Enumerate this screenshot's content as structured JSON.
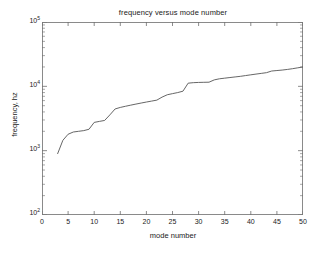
{
  "chart_data": {
    "type": "line",
    "title": "frequency versus mode number",
    "xlabel": "mode number",
    "ylabel": "frequency, hz",
    "xlim": [
      0,
      50
    ],
    "ylim": [
      100,
      100000
    ],
    "yscale": "log",
    "xscale": "linear",
    "grid": false,
    "legend": null,
    "xticks": [
      0,
      5,
      10,
      15,
      20,
      25,
      30,
      35,
      40,
      45,
      50
    ],
    "xtick_labels": [
      "0",
      "5",
      "10",
      "15",
      "20",
      "25",
      "30",
      "35",
      "40",
      "45",
      "50"
    ],
    "yticks": [
      100,
      1000,
      10000,
      100000
    ],
    "ytick_labels": [
      "10",
      "10",
      "10",
      "10"
    ],
    "ytick_exponents": [
      "2",
      "3",
      "4",
      "5"
    ],
    "line_color": "#555555",
    "x": [
      3,
      4,
      5,
      6,
      7,
      8,
      9,
      10,
      11,
      12,
      13,
      14,
      15,
      16,
      17,
      18,
      19,
      20,
      21,
      22,
      23,
      24,
      25,
      26,
      27,
      28,
      29,
      30,
      31,
      32,
      33,
      34,
      35,
      36,
      37,
      38,
      39,
      40,
      41,
      42,
      43,
      44,
      45,
      46,
      47,
      48,
      49,
      50
    ],
    "values": [
      900,
      1450,
      1800,
      1950,
      2000,
      2050,
      2150,
      2750,
      2850,
      2950,
      3600,
      4450,
      4700,
      4900,
      5100,
      5300,
      5500,
      5700,
      5900,
      6100,
      6800,
      7400,
      7700,
      8000,
      8400,
      11200,
      11400,
      11500,
      11550,
      11600,
      12600,
      13100,
      13400,
      13700,
      14000,
      14300,
      14700,
      15100,
      15500,
      15900,
      16300,
      17300,
      17600,
      17900,
      18300,
      18800,
      19400,
      20000
    ],
    "series_name": "frequency"
  }
}
